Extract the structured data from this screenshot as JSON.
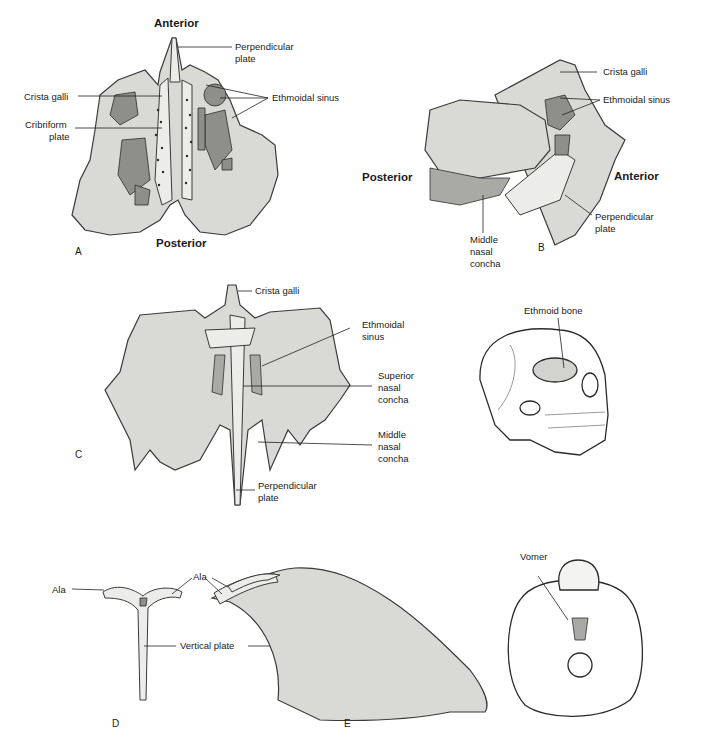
{
  "figure": {
    "panels": {
      "A": {
        "letter": "A",
        "orientation": {
          "top": "Anterior",
          "bottom": "Posterior"
        },
        "labels": {
          "perpendicular_plate_1": "Perpendicular",
          "perpendicular_plate_2": "plate",
          "crista_galli": "Crista galli",
          "cribriform_plate_1": "Cribriform",
          "cribriform_plate_2": "plate",
          "ethmoidal_sinus": "Ethmoidal sinus"
        }
      },
      "B": {
        "letter": "B",
        "orientation": {
          "left": "Posterior",
          "right": "Anterior"
        },
        "labels": {
          "crista_galli": "Crista galli",
          "ethmoidal_sinus": "Ethmoidal sinus",
          "perpendicular_plate_1": "Perpendicular",
          "perpendicular_plate_2": "plate",
          "middle_nasal_concha_1": "Middle",
          "middle_nasal_concha_2": "nasal",
          "middle_nasal_concha_3": "concha"
        }
      },
      "C": {
        "letter": "C",
        "labels": {
          "crista_galli": "Crista galli",
          "ethmoidal_sinus_1": "Ethmoidal",
          "ethmoidal_sinus_2": "sinus",
          "superior_nasal_concha_1": "Superior",
          "superior_nasal_concha_2": "nasal",
          "superior_nasal_concha_3": "concha",
          "middle_nasal_concha_1": "Middle",
          "middle_nasal_concha_2": "nasal",
          "middle_nasal_concha_3": "concha",
          "perpendicular_plate_1": "Perpendicular",
          "perpendicular_plate_2": "plate"
        }
      },
      "skull_lateral": {
        "labels": {
          "ethmoid_bone": "Ethmoid bone"
        }
      },
      "D": {
        "letter": "D",
        "labels": {
          "ala_left": "Ala",
          "vertical_plate": "Vertical plate"
        }
      },
      "E": {
        "letter": "E",
        "labels": {
          "ala": "Ala"
        }
      },
      "skull_inferior": {
        "labels": {
          "vomer": "Vomer"
        }
      }
    }
  }
}
